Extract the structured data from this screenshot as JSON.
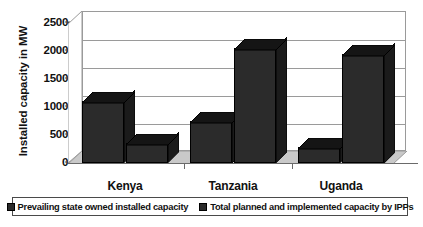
{
  "chart_data": {
    "type": "bar",
    "title": "",
    "xlabel": "",
    "ylabel": "Installed capacity in MW",
    "ylim": [
      0,
      2500
    ],
    "yticks": [
      0,
      500,
      1000,
      1500,
      2000,
      2500
    ],
    "ytick_labels": [
      "0",
      "500",
      "1000",
      "1500",
      "2000",
      "2500"
    ],
    "categories": [
      "Kenya",
      "Tanzania",
      "Uganda"
    ],
    "grid": true,
    "legend_position": "bottom",
    "style": "3d-clustered-column",
    "series": [
      {
        "name": "Prevailing state owned installed capacity",
        "values": [
          1100,
          750,
          280
        ],
        "color": "#2b2b2b"
      },
      {
        "name": "Total planned and implemented capacity by IPPs",
        "values": [
          350,
          2050,
          1950
        ],
        "color": "#2b2b2b"
      }
    ]
  },
  "axis": {
    "y_title": "Installed capacity in MW"
  },
  "legend": {
    "items": [
      {
        "label": "Prevailing state owned installed capacity"
      },
      {
        "label": "Total planned and implemented capacity by IPPs"
      }
    ]
  }
}
